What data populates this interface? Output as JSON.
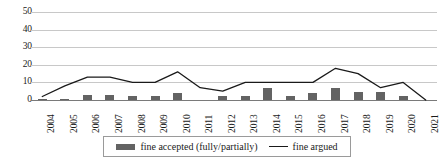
{
  "chart_data": {
    "type": "bar",
    "title": "",
    "subtitle": "",
    "xlabel": "",
    "ylabel": "",
    "ylim": [
      0,
      50
    ],
    "yticks": [
      0,
      10,
      20,
      30,
      40,
      50
    ],
    "grid": true,
    "legend_position": "bottom",
    "categories": [
      "2004",
      "2005",
      "2006",
      "2007",
      "2008",
      "2009",
      "2010",
      "2011",
      "2012",
      "2013",
      "2014",
      "2015",
      "2016",
      "2017",
      "2018",
      "2019",
      "2020",
      "2021"
    ],
    "series": [
      {
        "name": "fine accepted (fully/partially)",
        "type": "bar",
        "color": "#636363",
        "values": [
          0.5,
          0.5,
          3,
          3,
          2,
          2,
          4,
          0,
          2,
          2,
          7,
          2,
          4,
          7,
          4.5,
          4.5,
          2,
          0
        ]
      },
      {
        "name": "fine argued",
        "type": "line",
        "color": "#1a1a1a",
        "values": [
          2,
          8,
          13,
          13,
          10,
          10,
          16,
          7,
          5,
          10,
          10,
          10,
          10,
          18,
          15,
          7,
          10,
          0
        ]
      }
    ]
  },
  "legend": {
    "items": [
      {
        "label": "fine accepted (fully/partially)",
        "marker": "bar-swatch"
      },
      {
        "label": "fine argued",
        "marker": "line-swatch"
      }
    ]
  },
  "axis": {
    "y_tick_labels": [
      "50",
      "40",
      "30",
      "20",
      "10",
      "0"
    ]
  }
}
